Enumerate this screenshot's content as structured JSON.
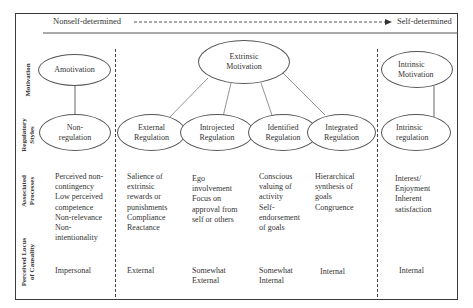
{
  "header": {
    "left_label": "Nonself-determined",
    "right_label": "Self-determined"
  },
  "row_labels": {
    "motivation": "Motivation",
    "regulatory_styles_1": "Regulatory",
    "regulatory_styles_2": "Styles",
    "associated_processes_1": "Associated",
    "associated_processes_2": "Processes",
    "locus_1": "Perceived Locus",
    "locus_2": "of Causality"
  },
  "motivation": {
    "amotivation": "Amotivation",
    "extrinsic_1": "Extrinsic",
    "extrinsic_2": "Motivation",
    "intrinsic_1": "Intrinsic",
    "intrinsic_2": "Motivation"
  },
  "regulatory_styles": [
    {
      "l1": "Non-",
      "l2": "regulation"
    },
    {
      "l1": "External",
      "l2": "Regulation"
    },
    {
      "l1": "Introjected",
      "l2": "Regulation"
    },
    {
      "l1": "Identified",
      "l2": "Regulation"
    },
    {
      "l1": "Integrated",
      "l2": "Regulation"
    },
    {
      "l1": "Intrinsic",
      "l2": "regulation"
    }
  ],
  "associated_processes": [
    [
      "Perceived non-",
      "contingency",
      "Low perceived",
      "competence",
      "Non-relevance",
      "Non-",
      "intentionality"
    ],
    [
      "Salience of",
      "extrinsic",
      "rewards or",
      "punishments",
      "Compliance",
      "Reactance"
    ],
    [
      "Ego",
      "involvement",
      "Focus on",
      "approval from",
      "self or others"
    ],
    [
      "Conscious",
      "valuing of",
      "activity",
      "Self-",
      "endorsement",
      "of goals"
    ],
    [
      "Hierarchical",
      "synthesis of",
      "goals",
      "Congruence"
    ],
    [
      "Interest/",
      "Enjoyment",
      "Inherent",
      "satisfaction"
    ]
  ],
  "locus_of_causality": [
    {
      "l1": "Impersonal",
      "l2": ""
    },
    {
      "l1": "External",
      "l2": ""
    },
    {
      "l1": "Somewhat",
      "l2": "External"
    },
    {
      "l1": "Somewhat",
      "l2": "Internal"
    },
    {
      "l1": "Internal",
      "l2": ""
    },
    {
      "l1": "Internal",
      "l2": ""
    }
  ]
}
